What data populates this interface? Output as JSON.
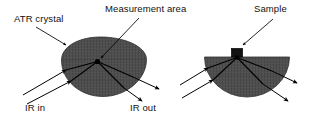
{
  "figure": {
    "type": "diagram",
    "background_color": "#ffffff",
    "crystal_fill_color": "#4a4a4a",
    "line_color": "#000000",
    "labels": {
      "atr_crystal": "ATR crystal",
      "measurement_area": "Measurement area",
      "sample": "Sample",
      "ir_in": "IR in",
      "ir_out": "IR out"
    },
    "panels": [
      {
        "name": "left-panel",
        "shape": "ellipse-crystal",
        "callouts": [
          "ATR crystal",
          "Measurement area"
        ],
        "beam_labels": [
          "IR in",
          "IR out"
        ],
        "incoming_beams": 2,
        "outgoing_beams": 2
      },
      {
        "name": "right-panel",
        "shape": "hemisphere-crystal",
        "callouts": [
          "Sample"
        ],
        "incoming_beams": 2,
        "outgoing_beams": 2
      }
    ]
  }
}
